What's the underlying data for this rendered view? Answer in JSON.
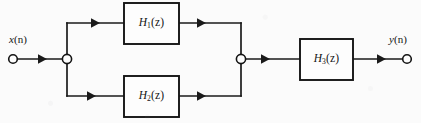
{
  "figure": {
    "kind": "signal-flow-block-diagram",
    "background_color": "#fbfbfb",
    "line_color": "#1a1a1a"
  },
  "io": {
    "input": {
      "label_var": "x",
      "label_arg": "(n)",
      "label": "x(n)",
      "terminal": {
        "cx": 13,
        "cy": 59,
        "r": 4.3
      }
    },
    "output": {
      "label_var": "y",
      "label_arg": "(n)",
      "label": "y(n)",
      "terminal": {
        "cx": 407,
        "cy": 59,
        "r": 4.3
      }
    }
  },
  "nodes": [
    {
      "name": "split-node",
      "cx": 67,
      "cy": 59,
      "r": 4.6
    },
    {
      "name": "sum-node",
      "cx": 241,
      "cy": 59,
      "r": 4.6
    }
  ],
  "blocks": [
    {
      "id": "h1",
      "label": "H1(z)",
      "label_main": "H",
      "label_sub": "1",
      "label_arg": "(z)",
      "x": 124,
      "y": 3,
      "w": 55,
      "h": 41
    },
    {
      "id": "h2",
      "label": "H2(z)",
      "label_main": "H",
      "label_sub": "2",
      "label_arg": "(z)",
      "x": 124,
      "y": 76,
      "w": 55,
      "h": 41
    },
    {
      "id": "h3",
      "label": "H3(z)",
      "label_main": "H",
      "label_sub": "3",
      "label_arg": "(z)",
      "x": 300,
      "y": 39,
      "w": 53,
      "h": 41
    }
  ],
  "wires": [
    {
      "name": "input-to-split",
      "path": "M 17.5 59 L 67 59"
    },
    {
      "name": "split-vertical",
      "path": "M 67 23 L 67 96"
    },
    {
      "name": "split-to-h1",
      "path": "M 67 23 L 124 23"
    },
    {
      "name": "split-to-h2",
      "path": "M 67 96 L 124 96"
    },
    {
      "name": "h1-to-sum",
      "path": "M 179 23 L 241 23"
    },
    {
      "name": "h2-to-sum",
      "path": "M 179 96 L 241 96"
    },
    {
      "name": "sum-vertical",
      "path": "M 241 23 L 241 96"
    },
    {
      "name": "sum-to-h3",
      "path": "M 241 59 L 300 59"
    },
    {
      "name": "h3-to-output",
      "path": "M 353 59 L 402.5 59"
    }
  ],
  "arrowheads": [
    {
      "name": "arrow-input",
      "x": 47,
      "y": 59
    },
    {
      "name": "arrow-into-h1",
      "x": 100,
      "y": 23
    },
    {
      "name": "arrow-into-h2",
      "x": 96,
      "y": 96
    },
    {
      "name": "arrow-out-h1",
      "x": 206,
      "y": 23
    },
    {
      "name": "arrow-out-h2",
      "x": 206,
      "y": 96
    },
    {
      "name": "arrow-into-h3",
      "x": 270,
      "y": 59
    },
    {
      "name": "arrow-output",
      "x": 386,
      "y": 59
    }
  ]
}
